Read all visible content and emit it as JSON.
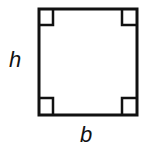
{
  "diagram": {
    "shape": "square",
    "labels": {
      "height": "h",
      "base": "b"
    },
    "right_angle_markers": 4,
    "stroke_color": "#111111"
  }
}
